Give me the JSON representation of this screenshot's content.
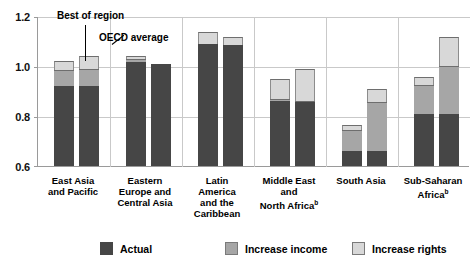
{
  "chart_data": {
    "type": "bar",
    "subtype": "grouped-stacked",
    "title": "",
    "xlabel": "",
    "ylabel": "",
    "ylim": [
      0.6,
      1.2
    ],
    "yticks": [
      "0.6",
      "0.8",
      "1.0",
      "1.2"
    ],
    "ytick_values": [
      0.6,
      0.8,
      1.0,
      1.2
    ],
    "grid": true,
    "legend_position": "bottom",
    "categories": [
      "East Asia and Pacific",
      "Eastern Europe and Central Asia",
      "Latin America and the Caribbean",
      "Middle East and North Africa",
      "South Asia",
      "Sub-Saharan Africa"
    ],
    "bar_groups": [
      "Best of region",
      "OECD average"
    ],
    "stack_order": [
      "Actual",
      "Increase income",
      "Increase rights"
    ],
    "series": [
      {
        "name": "Actual",
        "color": "#464646",
        "values_best": [
          0.92,
          1.015,
          1.09,
          0.86,
          0.66,
          0.81
        ],
        "values_oecd": [
          0.92,
          1.01,
          1.085,
          0.855,
          0.66,
          0.81
        ]
      },
      {
        "name": "Increase income",
        "color": "#a6a6a6",
        "values_best": [
          0.985,
          1.03,
          1.09,
          0.87,
          0.745,
          0.925
        ],
        "values_oecd": [
          0.99,
          1.01,
          1.085,
          0.862,
          0.855,
          1.0
        ]
      },
      {
        "name": "Increase rights",
        "color": "#d8d8d8",
        "values_best": [
          1.02,
          1.04,
          1.135,
          0.95,
          0.765,
          0.955
        ],
        "values_oecd": [
          1.04,
          1.01,
          1.115,
          0.99,
          0.91,
          1.115
        ]
      }
    ],
    "annotations": [
      {
        "text": "Best of region",
        "target": "East Asia and Pacific / Best of region bar"
      },
      {
        "text": "OECD average",
        "target": "East Asia and Pacific / OECD average bar"
      }
    ]
  },
  "axis": {
    "y_ticks": [
      {
        "label": "1.2",
        "value": 1.2
      },
      {
        "label": "1.0",
        "value": 1.0
      },
      {
        "label": "0.8",
        "value": 0.8
      },
      {
        "label": "0.6",
        "value": 0.6
      }
    ]
  },
  "annotations": {
    "best_of_region": "Best of region",
    "oecd_average": "OECD average"
  },
  "categories": [
    {
      "line1": "East Asia",
      "line2": "and Pacific",
      "line3": "",
      "line4": "",
      "sup": ""
    },
    {
      "line1": "Eastern",
      "line2": "Europe and",
      "line3": "Central Asia",
      "line4": "",
      "sup": ""
    },
    {
      "line1": "Latin",
      "line2": "America",
      "line3": "and the",
      "line4": "Caribbean",
      "sup": ""
    },
    {
      "line1": "Middle East",
      "line2": "and",
      "line3": "North Africa",
      "line4": "",
      "sup": "b"
    },
    {
      "line1": "South Asia",
      "line2": "",
      "line3": "",
      "line4": "",
      "sup": ""
    },
    {
      "line1": "Sub-Saharan",
      "line2": "Africa",
      "line3": "",
      "line4": "",
      "sup": "b"
    }
  ],
  "legend": {
    "items": [
      {
        "label": "Actual",
        "color": "#464646"
      },
      {
        "label": "Increase income",
        "color": "#a6a6a6"
      },
      {
        "label": "Increase rights",
        "color": "#d8d8d8"
      }
    ]
  }
}
